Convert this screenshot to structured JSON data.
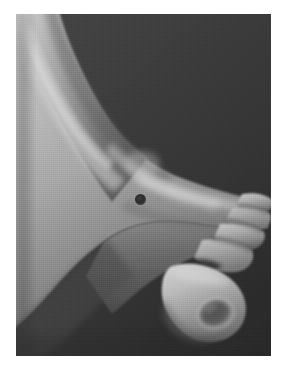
{
  "figure": {
    "kind": "clinical-photograph",
    "modality": "black-and-white photograph",
    "view": "oblique dorsolateral view, foot pointing to lower right",
    "border": {
      "style": "white photographic margin",
      "color": "#ffffff"
    }
  },
  "palette": {
    "page_background": "#ffffff",
    "photo_background": "#3b3b3b",
    "photo_background_dark": "#2e2e2e",
    "skin_shadow": "#5c5c5c",
    "skin_mid": "#8d8d8d",
    "skin_light": "#b9b9b9",
    "skin_highlight": "#d6d6d6",
    "lesion": "#2a2a2a",
    "toe_cleft": "#3a3a3a"
  },
  "annotations": {
    "lesion": {
      "label": "pigmented lesion",
      "shape": "circle",
      "center_x": 140,
      "center_y": 185,
      "diameter_px": 11,
      "color": "#2a2a2a",
      "location": "dorsum of foot, proximal to the metatarsal heads"
    }
  },
  "regions": [
    {
      "name": "lower-leg",
      "description": "shin and calf entering from the upper left corner"
    },
    {
      "name": "ankle",
      "description": "ankle region mid-frame with anterior tendon highlight"
    },
    {
      "name": "foot-dorsum",
      "description": "broad bright top surface of the foot"
    },
    {
      "name": "foot-sole-edge",
      "description": "shadowed plantar margin along the lower contour"
    },
    {
      "name": "toes",
      "description": "four lesser toes stacked toward the right edge"
    },
    {
      "name": "great-toe",
      "description": "great toe at the bottom right showing the toenail"
    },
    {
      "name": "toenail",
      "description": "oval nail plate on the great toe"
    }
  ],
  "photo_geometry": {
    "plate_left": 16,
    "plate_top": 14,
    "plate_width": 255,
    "plate_height": 342
  }
}
